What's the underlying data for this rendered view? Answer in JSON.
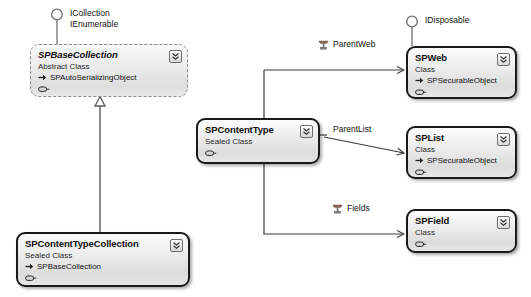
{
  "diagram": {
    "kind": "uml-class-diagram",
    "width": 531,
    "height": 297,
    "background": "#ffffff",
    "border_color": "#1a1a1a",
    "abstract_border_color": "#8a8a8a",
    "fill_top": "#fbfbfb",
    "fill_bottom": "#dcdcdc"
  },
  "classes": [
    {
      "id": "spbasecollection",
      "name": "SPBaseCollection",
      "stereotype": "Abstract Class",
      "base": "SPAutoSerializingObject",
      "abstract": true,
      "interfaces": [
        "ICollection",
        "IEnumerable"
      ]
    },
    {
      "id": "spcontenttypecollection",
      "name": "SPContentTypeCollection",
      "stereotype": "Sealed Class",
      "base": "SPBaseCollection",
      "abstract": false,
      "interfaces": []
    },
    {
      "id": "spcontenttype",
      "name": "SPContentType",
      "stereotype": "Sealed Class",
      "base": "",
      "abstract": false,
      "interfaces": []
    },
    {
      "id": "spweb",
      "name": "SPWeb",
      "stereotype": "Class",
      "base": "SPSecurableObject",
      "abstract": false,
      "interfaces": [
        "IDisposable"
      ]
    },
    {
      "id": "splist",
      "name": "SPList",
      "stereotype": "Class",
      "base": "SPSecurableObject",
      "abstract": false,
      "interfaces": []
    },
    {
      "id": "spfield",
      "name": "SPField",
      "stereotype": "Class",
      "base": "",
      "abstract": false,
      "interfaces": []
    }
  ],
  "interface_labels": [
    {
      "id": "icollection",
      "line1": "ICollection",
      "line2": "IEnumerable"
    },
    {
      "id": "idisposable",
      "line1": "IDisposable",
      "line2": ""
    }
  ],
  "associations": [
    {
      "id": "parentweb",
      "label": "ParentWeb",
      "from": "spcontenttype",
      "to": "spweb"
    },
    {
      "id": "parentlist",
      "label": "ParentList",
      "from": "spcontenttype",
      "to": "splist"
    },
    {
      "id": "fields",
      "label": "Fields",
      "from": "spcontenttype",
      "to": "spfield"
    }
  ],
  "inheritances": [
    {
      "id": "ctc-to-base",
      "from": "spcontenttypecollection",
      "to": "spbasecollection"
    }
  ],
  "icons": {
    "collapse": "double-chevron-down-icon",
    "base_arrow": "inheritance-arrow-icon",
    "member": "property-icon",
    "association": "association-icon",
    "lollipop": "interface-lollipop-icon"
  }
}
